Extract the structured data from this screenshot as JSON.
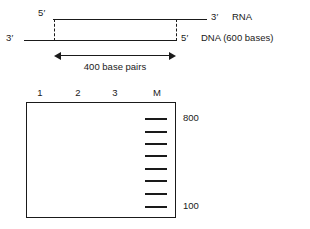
{
  "diagram": {
    "rna_strand": {
      "five_prime": "5′",
      "three_prime": "3′",
      "name": "RNA"
    },
    "dna_strand": {
      "three_prime": "3′",
      "five_prime": "5′",
      "name": "DNA (600 bases)"
    },
    "span_label": "400 base pairs"
  },
  "gel": {
    "lane_labels": [
      "1",
      "2",
      "3",
      "M"
    ],
    "marker_lane": "M",
    "size_top": "800",
    "size_bottom": "100",
    "bands": [
      {
        "y": 118
      },
      {
        "y": 131
      },
      {
        "y": 143
      },
      {
        "y": 155
      },
      {
        "y": 168
      },
      {
        "y": 180
      },
      {
        "y": 193
      },
      {
        "y": 206
      }
    ]
  },
  "colors": {
    "ink": "#1a1a1a",
    "background": "#ffffff"
  }
}
